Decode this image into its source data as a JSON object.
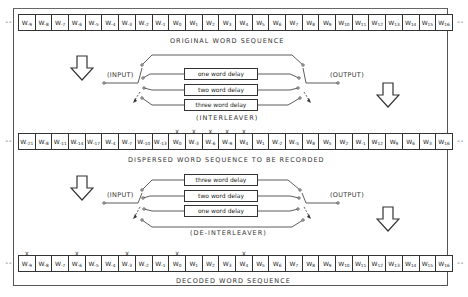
{
  "rows": {
    "original": {
      "label": "ORIGINAL WORD SEQUENCE",
      "cells": [
        {
          "w": "W",
          "s": "-9"
        },
        {
          "w": "W",
          "s": "-8"
        },
        {
          "w": "W",
          "s": "-7"
        },
        {
          "w": "W",
          "s": "-6"
        },
        {
          "w": "W",
          "s": "-5"
        },
        {
          "w": "W",
          "s": "-4"
        },
        {
          "w": "W",
          "s": "-3"
        },
        {
          "w": "W",
          "s": "-2"
        },
        {
          "w": "W",
          "s": "-1"
        },
        {
          "w": "W",
          "s": "0"
        },
        {
          "w": "W",
          "s": "1"
        },
        {
          "w": "W",
          "s": "2"
        },
        {
          "w": "W",
          "s": "3"
        },
        {
          "w": "W",
          "s": "4"
        },
        {
          "w": "W",
          "s": "5"
        },
        {
          "w": "W",
          "s": "6"
        },
        {
          "w": "W",
          "s": "7"
        },
        {
          "w": "W",
          "s": "8"
        },
        {
          "w": "W",
          "s": "9"
        },
        {
          "w": "W",
          "s": "10"
        },
        {
          "w": "W",
          "s": "11"
        },
        {
          "w": "W",
          "s": "12"
        },
        {
          "w": "W",
          "s": "13"
        },
        {
          "w": "W",
          "s": "14"
        },
        {
          "w": "W",
          "s": "15"
        },
        {
          "w": "W",
          "s": "16"
        }
      ],
      "marked": []
    },
    "dispersed": {
      "label": "DISPERSED WORD SEQUENCE TO BE RECORDED",
      "cells": [
        {
          "w": "W",
          "s": "-21"
        },
        {
          "w": "W",
          "s": "-8"
        },
        {
          "w": "W",
          "s": "-11"
        },
        {
          "w": "W",
          "s": "-14"
        },
        {
          "w": "W",
          "s": "-17"
        },
        {
          "w": "W",
          "s": "-4"
        },
        {
          "w": "W",
          "s": "-7"
        },
        {
          "w": "W",
          "s": "-10"
        },
        {
          "w": "W",
          "s": "-13"
        },
        {
          "w": "W",
          "s": "0"
        },
        {
          "w": "W",
          "s": "-3"
        },
        {
          "w": "W",
          "s": "-6"
        },
        {
          "w": "W",
          "s": "-9"
        },
        {
          "w": "W",
          "s": "4"
        },
        {
          "w": "W",
          "s": "1"
        },
        {
          "w": "W",
          "s": "-2"
        },
        {
          "w": "W",
          "s": "-5"
        },
        {
          "w": "W",
          "s": "8"
        },
        {
          "w": "W",
          "s": "5"
        },
        {
          "w": "W",
          "s": "2"
        },
        {
          "w": "W",
          "s": "-1"
        },
        {
          "w": "W",
          "s": "12"
        },
        {
          "w": "W",
          "s": "9"
        },
        {
          "w": "W",
          "s": "6"
        },
        {
          "w": "W",
          "s": "3"
        },
        {
          "w": "W",
          "s": "16"
        }
      ],
      "marked": [
        9,
        10,
        11,
        12,
        13
      ]
    },
    "decoded": {
      "label": "DECODED WORD SEQUENCE",
      "cells": [
        {
          "w": "W",
          "s": "-9"
        },
        {
          "w": "W",
          "s": "-8"
        },
        {
          "w": "W",
          "s": "-7"
        },
        {
          "w": "W",
          "s": "-6"
        },
        {
          "w": "W",
          "s": "-5"
        },
        {
          "w": "W",
          "s": "-4"
        },
        {
          "w": "W",
          "s": "-3"
        },
        {
          "w": "W",
          "s": "-2"
        },
        {
          "w": "W",
          "s": "-1"
        },
        {
          "w": "W",
          "s": "0"
        },
        {
          "w": "W",
          "s": "1"
        },
        {
          "w": "W",
          "s": "2"
        },
        {
          "w": "W",
          "s": "3"
        },
        {
          "w": "W",
          "s": "4"
        },
        {
          "w": "W",
          "s": "5"
        },
        {
          "w": "W",
          "s": "6"
        },
        {
          "w": "W",
          "s": "7"
        },
        {
          "w": "W",
          "s": "8"
        },
        {
          "w": "W",
          "s": "9"
        },
        {
          "w": "W",
          "s": "10"
        },
        {
          "w": "W",
          "s": "11"
        },
        {
          "w": "W",
          "s": "12"
        },
        {
          "w": "W",
          "s": "13"
        },
        {
          "w": "W",
          "s": "14"
        },
        {
          "w": "W",
          "s": "15"
        },
        {
          "w": "W",
          "s": "16"
        }
      ],
      "marked": [
        0,
        3,
        6,
        9,
        13
      ]
    }
  },
  "continuation": "--",
  "mark_glyph": "X",
  "interleaver": {
    "input_label": "(INPUT)",
    "output_label": "(OUTPUT)",
    "caption": "(INTERLEAVER)",
    "delays": [
      "one word delay",
      "two word delay",
      "three word delay"
    ]
  },
  "deinterleaver": {
    "input_label": "(INPUT)",
    "output_label": "(OUTPUT)",
    "caption": "(DE-INTERLEAVER)",
    "delays": [
      "three word delay",
      "two word delay",
      "one word delay"
    ]
  },
  "icons": {
    "flow_arrow": "down-arrow-outline"
  }
}
